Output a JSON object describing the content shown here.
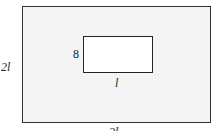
{
  "diagram": {
    "outer_rect": {
      "width_label": "2l",
      "height_label": "2l",
      "fill": "#f4f4f4"
    },
    "inner_rect": {
      "width_label": "l",
      "height_label": "8",
      "fill": "#ffffff"
    }
  }
}
